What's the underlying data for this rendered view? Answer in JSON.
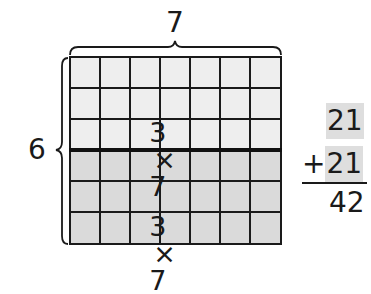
{
  "diagram": {
    "type": "area-model-multiplication",
    "width_label": "7",
    "height_label": "6",
    "grid": {
      "columns": 7,
      "rows": 6,
      "split_after_row": 3,
      "top_fill": "#eeeeee",
      "bottom_fill": "#dadada",
      "line_color": "#1a1a1a"
    },
    "top_product": {
      "left": "3",
      "op": "×",
      "right": "7"
    },
    "bottom_product": {
      "left": "3",
      "op": "×",
      "right": "7"
    },
    "addition": {
      "addend1": "21",
      "plus": "+",
      "addend2": "21",
      "sum": "42",
      "highlight_color": "#dedede"
    }
  }
}
